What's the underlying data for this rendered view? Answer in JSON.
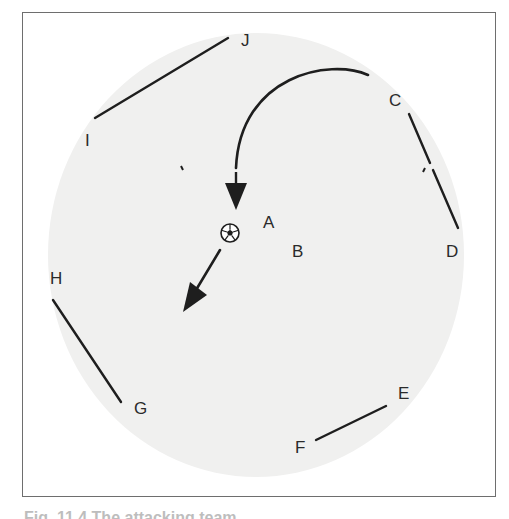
{
  "figure": {
    "background_field": {
      "shape": "ellipse",
      "cx": 256,
      "cy": 255,
      "rx": 208,
      "ry": 222,
      "color": "#f0f0ef"
    },
    "line_color": "#1e1e1e",
    "segments": [
      {
        "id": "IJ",
        "from": "I",
        "to": "J",
        "x1": 95,
        "y1": 118,
        "x2": 228,
        "y2": 38
      },
      {
        "id": "CD_upper",
        "from": "C",
        "to": "D",
        "x1": 409,
        "y1": 114,
        "x2": 430,
        "y2": 163
      },
      {
        "id": "CD_lower",
        "from": "C",
        "to": "D",
        "x1": 433,
        "y1": 170,
        "x2": 458,
        "y2": 228
      },
      {
        "id": "HG",
        "from": "H",
        "to": "G",
        "x1": 53,
        "y1": 300,
        "x2": 121,
        "y2": 402
      },
      {
        "id": "FE",
        "from": "F",
        "to": "E",
        "x1": 316,
        "y1": 440,
        "x2": 386,
        "y2": 406
      }
    ],
    "labels": [
      {
        "text": "J",
        "x": 241,
        "y": 46
      },
      {
        "text": "I",
        "x": 85,
        "y": 146
      },
      {
        "text": "C",
        "x": 389,
        "y": 106
      },
      {
        "text": "A",
        "x": 263,
        "y": 228
      },
      {
        "text": "B",
        "x": 292,
        "y": 257
      },
      {
        "text": "D",
        "x": 446,
        "y": 257
      },
      {
        "text": "H",
        "x": 50,
        "y": 284
      },
      {
        "text": "G",
        "x": 134,
        "y": 414
      },
      {
        "text": "E",
        "x": 398,
        "y": 399
      },
      {
        "text": "F",
        "x": 295,
        "y": 453
      }
    ],
    "ball": {
      "name": "soccer-ball",
      "cx": 230,
      "cy": 233,
      "r": 9
    },
    "curved_arrow": {
      "start": [
        368,
        75
      ],
      "end": [
        236,
        168
      ],
      "head_tip": [
        236,
        210
      ]
    },
    "straight_arrow": {
      "start": [
        220,
        250
      ],
      "head_tip": [
        183,
        312
      ]
    },
    "tick_marks": [
      {
        "x1": 181,
        "y1": 166,
        "x2": 183,
        "y2": 170
      },
      {
        "x1": 425,
        "y1": 168,
        "x2": 423,
        "y2": 172
      }
    ]
  },
  "caption": {
    "text": "Fig. 11.4  The attacking team"
  }
}
